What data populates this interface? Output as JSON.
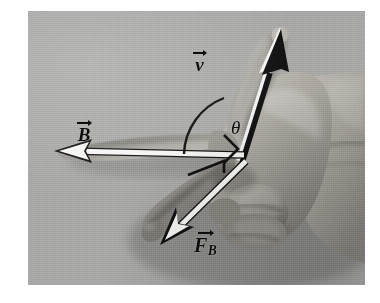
{
  "figure": {
    "kind": "photograph-diagram",
    "background_color": "#a8a8a6",
    "plate_border_color": "#ffffff",
    "ink_color": "#0d0d0d",
    "highlight_color": "#f7f7f5"
  },
  "labels": {
    "velocity": {
      "symbol": "v",
      "subscript": "",
      "overbar": "vector-arrow"
    },
    "magnetic_field": {
      "symbol": "B",
      "subscript": "",
      "overbar": "vector-arrow"
    },
    "magnetic_force": {
      "symbol": "F",
      "subscript": "B",
      "overbar": "vector-arrow"
    },
    "angle": {
      "symbol": "θ"
    }
  },
  "markers": {
    "angle_arc": "arc between v and B vectors",
    "right_angle": "right-angle square between B and F_B",
    "small_angle": "small angle tick below B vector"
  },
  "vectors": [
    {
      "name": "v",
      "direction": "up-right",
      "style": "black-filled-arrow-with-white-highlight",
      "along": "index-finger"
    },
    {
      "name": "B",
      "direction": "left",
      "style": "white-filled-arrow-black-outline",
      "along": "thumb"
    },
    {
      "name": "F_B",
      "direction": "down-left",
      "style": "white-filled-arrow-black-outline",
      "along": "middle-finger"
    }
  ]
}
